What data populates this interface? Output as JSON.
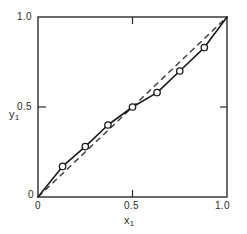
{
  "chart_data": {
    "type": "line",
    "title": "",
    "xlabel": "x1",
    "ylabel": "y1",
    "xlim": [
      0,
      1
    ],
    "ylim": [
      0,
      1
    ],
    "grid": false,
    "legend": "none",
    "xticks": [
      0,
      0.5,
      1.0
    ],
    "yticks": [
      0,
      0.5,
      1.0
    ],
    "xticklabels": [
      "0",
      "0.5",
      "1.0"
    ],
    "yticklabels": [
      "0",
      "0.5",
      "1.0"
    ],
    "series": [
      {
        "name": "equilibrium-curve",
        "style": "solid-with-open-circle-markers",
        "x": [
          0.0,
          0.13,
          0.25,
          0.37,
          0.5,
          0.63,
          0.75,
          0.88,
          1.0
        ],
        "y": [
          0.0,
          0.17,
          0.28,
          0.4,
          0.5,
          0.58,
          0.7,
          0.83,
          1.0
        ],
        "marker_x": [
          0.13,
          0.25,
          0.37,
          0.5,
          0.63,
          0.75,
          0.88
        ],
        "marker_y": [
          0.17,
          0.28,
          0.4,
          0.5,
          0.58,
          0.7,
          0.83
        ]
      },
      {
        "name": "diagonal-reference-line",
        "style": "dashed",
        "x": [
          0.0,
          1.0
        ],
        "y": [
          0.0,
          1.0
        ]
      }
    ]
  },
  "axes": {
    "ylabel_main": "y",
    "ylabel_sub": "1",
    "xlabel_main": "x",
    "xlabel_sub": "1",
    "y_tick_top": "1.0",
    "y_tick_mid": "0.5",
    "y_tick_bottom": "0",
    "x_tick_left": "0",
    "x_tick_mid": "0.5",
    "x_tick_right": "1.0"
  },
  "colors": {
    "frame": "#2b2b2b",
    "curve": "#1a1a1a",
    "dashed": "#3a3a3a",
    "marker_fill": "#ffffff",
    "background": "#ffffff"
  }
}
